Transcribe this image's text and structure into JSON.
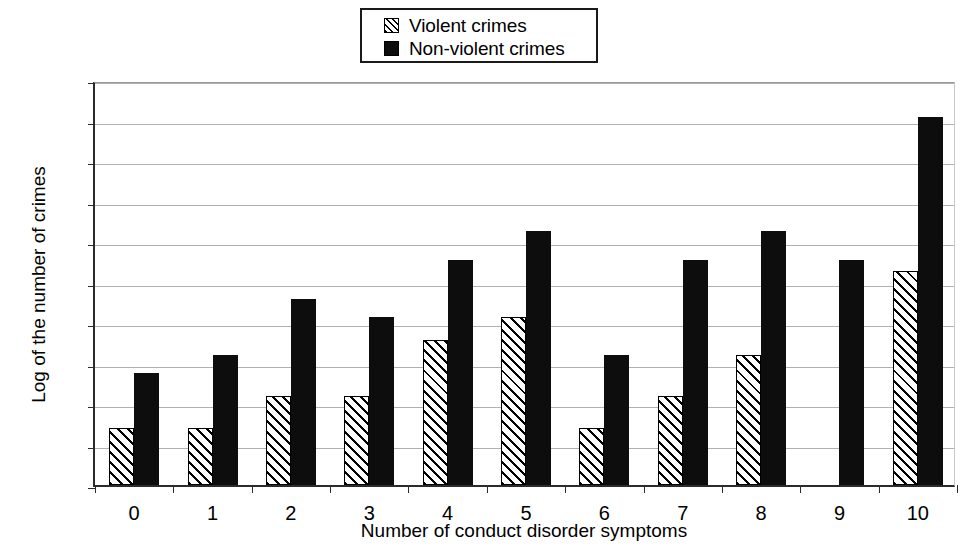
{
  "legend": {
    "position": "top-center",
    "entries": [
      {
        "label": "Violent crimes",
        "swatch": "hatched-diagonal-swatch",
        "color": "#ffffff"
      },
      {
        "label": "Non-violent crimes",
        "swatch": "solid-black-swatch",
        "color": "#0d0d0d"
      }
    ]
  },
  "axes": {
    "y_title": "Log of the number of crimes",
    "x_title": "Number of conduct disorder symptoms",
    "y_ticks": [
      "0",
      "0.5",
      "1",
      "1.5",
      "2",
      "2.5",
      "3",
      "3.5",
      "4",
      "4.5",
      "5"
    ],
    "x_ticks": [
      "0",
      "1",
      "2",
      "3",
      "4",
      "5",
      "6",
      "7",
      "8",
      "9",
      "10"
    ]
  },
  "chart_data": {
    "type": "bar",
    "title": "",
    "xlabel": "Number of conduct disorder symptoms",
    "ylabel": "Log of the number of crimes",
    "categories": [
      "0",
      "1",
      "2",
      "3",
      "4",
      "5",
      "6",
      "7",
      "8",
      "9",
      "10"
    ],
    "series": [
      {
        "name": "Violent crimes",
        "color": "#ffffff",
        "pattern": "diagonal-hatch",
        "values": [
          0.7,
          0.7,
          1.1,
          1.1,
          1.79,
          2.08,
          0.7,
          1.1,
          1.61,
          null,
          2.64
        ]
      },
      {
        "name": "Non-violent crimes",
        "color": "#0d0d0d",
        "pattern": "solid",
        "values": [
          1.38,
          1.61,
          2.3,
          2.08,
          2.78,
          3.14,
          1.61,
          2.78,
          3.14,
          2.78,
          4.54
        ]
      }
    ],
    "ylim": [
      0,
      5
    ],
    "ytick_step": 0.5,
    "grid": true,
    "grid_axis": "y",
    "legend_position": "top-center"
  }
}
